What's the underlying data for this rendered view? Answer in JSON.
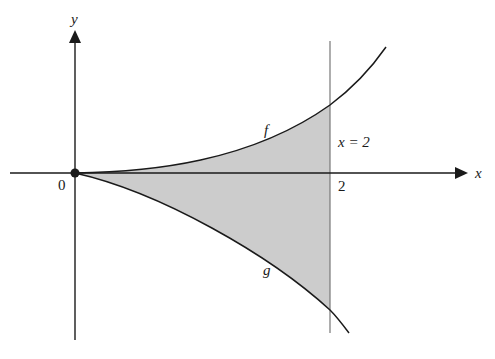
{
  "diagram": {
    "type": "area-between-curves",
    "axes": {
      "x_label": "x",
      "y_label": "y",
      "origin_label": "0",
      "x_tick_label": "2"
    },
    "curves": [
      {
        "name": "f",
        "label": "f",
        "side": "above x-axis",
        "behavior": "increasing, concave up from origin"
      },
      {
        "name": "g",
        "label": "g",
        "side": "below x-axis",
        "behavior": "decreasing from origin"
      }
    ],
    "vertical_line": {
      "label": "x = 2",
      "x": 2
    },
    "shaded_region": {
      "description": "region bounded by f, g and x = 2",
      "fill": "#cccccc"
    },
    "colors": {
      "axis": "#1a1a1a",
      "curve": "#1a1a1a",
      "vertical_line": "#777777",
      "shade": "#cccccc",
      "background": "#ffffff"
    }
  }
}
